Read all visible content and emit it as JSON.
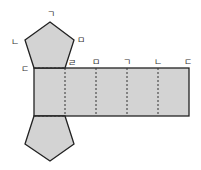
{
  "diagram": {
    "type": "net-of-pentagonal-prism",
    "fill_color": "#d3d3d3",
    "stroke_color": "#222222",
    "labels": {
      "top_apex": "ㄱ",
      "top_left": "ㄴ",
      "top_right": "ㅁ",
      "rect_top_left": "ㄷ",
      "rect_top_1": "ㄹ",
      "rect_top_2": "ㅁ",
      "rect_top_3": "ㄱ",
      "rect_top_4": "ㄴ",
      "rect_top_right": "ㄷ"
    }
  }
}
